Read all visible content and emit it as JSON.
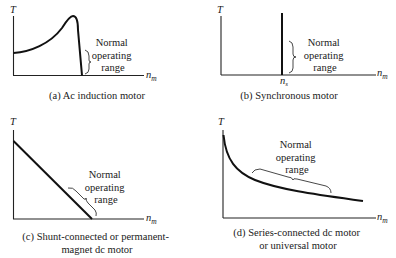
{
  "panels": [
    {
      "id": "a",
      "y_axis_label": "T",
      "x_axis_label": "n",
      "x_axis_sub": "m",
      "annotation": [
        "Normal",
        "operating",
        "range"
      ],
      "caption": [
        "(a) Ac induction motor"
      ]
    },
    {
      "id": "b",
      "y_axis_label": "T",
      "x_axis_label": "n",
      "x_axis_sub": "m",
      "tick_label": "n",
      "tick_sub": "s",
      "annotation": [
        "Normal",
        "operating",
        "range"
      ],
      "caption": [
        "(b) Synchronous motor"
      ]
    },
    {
      "id": "c",
      "y_axis_label": "T",
      "x_axis_label": "n",
      "x_axis_sub": "m",
      "annotation": [
        "Normal",
        "operating",
        "range"
      ],
      "caption": [
        "(c) Shunt-connected or permanent-",
        "magnet dc motor"
      ]
    },
    {
      "id": "d",
      "y_axis_label": "T",
      "x_axis_label": "n",
      "x_axis_sub": "m",
      "annotation": [
        "Normal",
        "operating",
        "range"
      ],
      "caption": [
        "(d) Series-connected dc motor",
        "or universal motor"
      ]
    }
  ],
  "colors": {
    "ink": "#111111",
    "background": "#ffffff"
  }
}
